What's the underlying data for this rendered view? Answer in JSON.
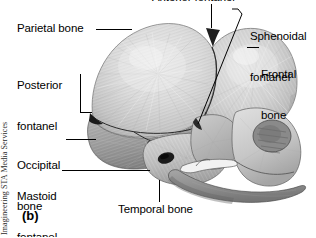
{
  "figure": {
    "panel_letter": "(b)",
    "credit": "Imagineering STA Media Services",
    "background_color": "#ffffff",
    "ink_color": "#000000",
    "bone_fill_light": "#d9d9d9",
    "bone_fill_mid": "#c4c4c4",
    "bone_fill_dark": "#9a9a9a",
    "bone_fill_shadow": "#7d7d7d"
  },
  "labels": {
    "anterior_fontanel": "Anterior fontanel",
    "parietal_bone": "Parietal bone",
    "posterior_fontanel_line1": "Posterior",
    "posterior_fontanel_line2": "fontanel",
    "occipital_bone_line1": "Occipital",
    "occipital_bone_line2": "bone",
    "mastoid_fontanel_line1": "Mastoid",
    "mastoid_fontanel_line2": "fontanel",
    "temporal_bone": "Temporal bone",
    "sphenoidal_fontanel_line1": "Sphenoidal",
    "sphenoidal_fontanel_line2": "fontanel",
    "frontal_bone_line1": "Frontal",
    "frontal_bone_line2": "bone"
  },
  "structures": [
    {
      "name": "anterior-fontanel",
      "type": "fontanel"
    },
    {
      "name": "parietal-bone",
      "type": "bone"
    },
    {
      "name": "posterior-fontanel",
      "type": "fontanel"
    },
    {
      "name": "occipital-bone",
      "type": "bone"
    },
    {
      "name": "mastoid-fontanel",
      "type": "fontanel"
    },
    {
      "name": "temporal-bone",
      "type": "bone"
    },
    {
      "name": "sphenoidal-fontanel",
      "type": "fontanel"
    },
    {
      "name": "frontal-bone",
      "type": "bone"
    },
    {
      "name": "mandible",
      "type": "bone"
    },
    {
      "name": "zygomatic-arch",
      "type": "bone"
    },
    {
      "name": "external-acoustic-meatus",
      "type": "opening"
    },
    {
      "name": "orbit",
      "type": "opening"
    }
  ]
}
